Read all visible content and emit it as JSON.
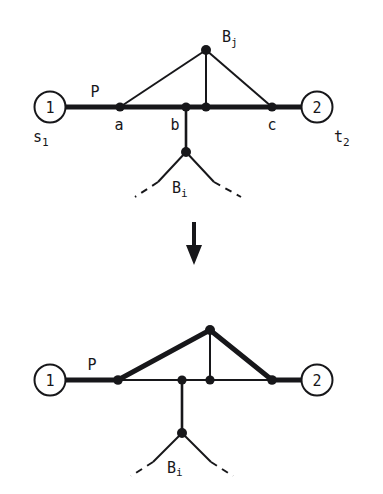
{
  "figure": {
    "kind": "graph-transformation-diagram",
    "colors": {
      "ink": "#17171a",
      "background": "#ffffff"
    },
    "panels": [
      {
        "id": "before",
        "labels": {
          "terminal_left_number": "1",
          "terminal_left_name": "s",
          "terminal_left_name_sub": "1",
          "terminal_right_number": "2",
          "terminal_right_name": "t",
          "terminal_right_name_sub": "2",
          "path_label": "P",
          "node_a": "a",
          "node_b": "b",
          "node_c": "c",
          "branch_top": "B",
          "branch_top_sub": "j",
          "branch_bottom": "B",
          "branch_bottom_sub": "i"
        }
      },
      {
        "id": "after",
        "labels": {
          "terminal_left_number": "1",
          "terminal_right_number": "2",
          "path_label": "P",
          "branch_bottom": "B",
          "branch_bottom_sub": "i"
        }
      }
    ],
    "transform_arrow": "down-arrow"
  }
}
